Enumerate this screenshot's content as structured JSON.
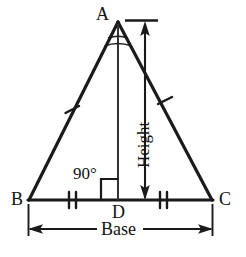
{
  "figure": {
    "type": "geometry-diagram",
    "stroke_color": "#1a1a1a",
    "background_color": "#ffffff",
    "labels": {
      "apex": "A",
      "base_left": "B",
      "base_right": "C",
      "foot_of_altitude": "D",
      "right_angle": "90°",
      "height_dimension": "Height",
      "base_dimension": "Base"
    },
    "markings": {
      "equal_sides_ticks": 1,
      "equal_base_segments_ticks": 2,
      "equal_angles_arcs": 2,
      "right_angle_square": true
    },
    "geometry": {
      "A": [
        118,
        22
      ],
      "B": [
        29,
        200
      ],
      "C": [
        212,
        200
      ],
      "D": [
        118,
        200
      ]
    }
  }
}
